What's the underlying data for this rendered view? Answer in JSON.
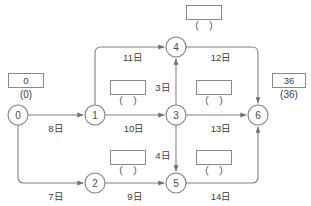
{
  "diagram": {
    "type": "pert-network-diagram",
    "title": "",
    "unit_suffix": "日",
    "colors": {
      "stroke": "#808080",
      "text": "#3c3c3c",
      "background": "#ffffff",
      "box_border": "#8a8a8a"
    },
    "nodes": [
      {
        "id": "n0",
        "label": "0",
        "cx": 18,
        "cy": 115,
        "r": 10
      },
      {
        "id": "n1",
        "label": "1",
        "cx": 95,
        "cy": 115,
        "r": 10
      },
      {
        "id": "n2",
        "label": "2",
        "cx": 95,
        "cy": 183,
        "r": 10
      },
      {
        "id": "n3",
        "label": "3",
        "cx": 176,
        "cy": 115,
        "r": 10
      },
      {
        "id": "n4",
        "label": "4",
        "cx": 176,
        "cy": 47,
        "r": 10
      },
      {
        "id": "n5",
        "label": "5",
        "cx": 176,
        "cy": 183,
        "r": 10
      },
      {
        "id": "n6",
        "label": "6",
        "cx": 258,
        "cy": 115,
        "r": 10
      }
    ],
    "edges": [
      {
        "id": "e01",
        "from": "0",
        "to": "1",
        "label": "8日",
        "duration": 8,
        "lx": 56,
        "ly": 128
      },
      {
        "id": "e02",
        "from": "0",
        "to": "2",
        "label": "7日",
        "duration": 7,
        "lx": 56,
        "ly": 196
      },
      {
        "id": "e14",
        "from": "1",
        "to": "4",
        "label": "11日",
        "duration": 11,
        "lx": 133,
        "ly": 57
      },
      {
        "id": "e13",
        "from": "1",
        "to": "3",
        "label": "10日",
        "duration": 10,
        "lx": 134,
        "ly": 128
      },
      {
        "id": "e25",
        "from": "2",
        "to": "5",
        "label": "9日",
        "duration": 9,
        "lx": 135,
        "ly": 196
      },
      {
        "id": "e34",
        "from": "3",
        "to": "4",
        "label": "3日",
        "duration": 3,
        "lx": 163,
        "ly": 87
      },
      {
        "id": "e35",
        "from": "3",
        "to": "5",
        "label": "4日",
        "duration": 4,
        "lx": 163,
        "ly": 155
      },
      {
        "id": "e46",
        "from": "4",
        "to": "6",
        "label": "12日",
        "duration": 12,
        "lx": 221,
        "ly": 57
      },
      {
        "id": "e36",
        "from": "3",
        "to": "6",
        "label": "13日",
        "duration": 13,
        "lx": 221,
        "ly": 128
      },
      {
        "id": "e56",
        "from": "5",
        "to": "6",
        "label": "14日",
        "duration": 14,
        "lx": 221,
        "ly": 196
      }
    ],
    "annotations": [
      {
        "id": "a0",
        "for_node": "0",
        "earliest": "0",
        "latest": "(0)",
        "box_x": 8,
        "box_y": 73,
        "box_w": 36,
        "paren_x": 8,
        "paren_y": 89,
        "paren_w": 36
      },
      {
        "id": "a1",
        "for_node": "1",
        "earliest": "",
        "latest": "（　）",
        "box_x": 110,
        "box_y": 80,
        "box_w": 36,
        "paren_x": 110,
        "paren_y": 96,
        "paren_w": 36
      },
      {
        "id": "a4",
        "for_node": "4",
        "earliest": "",
        "latest": "（　）",
        "box_x": 186,
        "box_y": 5,
        "box_w": 36,
        "paren_x": 186,
        "paren_y": 21,
        "paren_w": 36
      },
      {
        "id": "a3",
        "for_node": "3",
        "earliest": "",
        "latest": "（　）",
        "box_x": 196,
        "box_y": 80,
        "box_w": 36,
        "paren_x": 196,
        "paren_y": 96,
        "paren_w": 36
      },
      {
        "id": "a2",
        "for_node": "2",
        "earliest": "",
        "latest": "（　）",
        "box_x": 110,
        "box_y": 150,
        "box_w": 36,
        "paren_x": 110,
        "paren_y": 166,
        "paren_w": 36
      },
      {
        "id": "a5",
        "for_node": "5",
        "earliest": "",
        "latest": "（　）",
        "box_x": 196,
        "box_y": 150,
        "box_w": 36,
        "paren_x": 196,
        "paren_y": 166,
        "paren_w": 36
      },
      {
        "id": "a6",
        "for_node": "6",
        "earliest": "36",
        "latest": "(36)",
        "box_x": 272,
        "box_y": 73,
        "box_w": 34,
        "paren_x": 270,
        "paren_y": 89,
        "paren_w": 38
      }
    ]
  }
}
